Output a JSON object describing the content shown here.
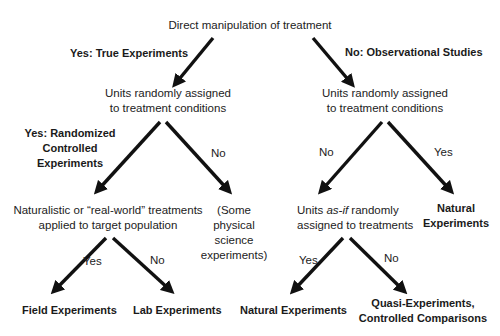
{
  "diagram": {
    "root": "Direct manipulation of treatment",
    "branch_labels": {
      "root_yes": "Yes: True Experiments",
      "root_no": "No: Observational Studies",
      "left_yes": "Yes: Randomized",
      "left_yes_2": "Controlled",
      "left_yes_3": "Experiments",
      "left_no": "No",
      "right_no": "No",
      "right_yes": "Yes",
      "ll_yes": "Yes",
      "ll_no": "No",
      "rl_yes": "Yes",
      "rl_no": "No"
    },
    "nodes": {
      "left_q_line1": "Units randomly assigned",
      "left_q_line2": "to treatment conditions",
      "right_q_line1": "Units randomly assigned",
      "right_q_line2": "to treatment conditions",
      "naturalistic_line1": "Naturalistic or “real-world” treatments",
      "naturalistic_line2": "applied to target population",
      "physical_line1": "(Some",
      "physical_line2": "physical",
      "physical_line3": "science",
      "physical_line4": "experiments)",
      "asif_pre": "Units ",
      "asif_em": "as-if",
      "asif_post": " randomly",
      "asif_line2": "assigned to treatments",
      "natural_exp_right_1": "Natural",
      "natural_exp_right_2": "Experiments",
      "field_exp": "Field Experiments",
      "lab_exp": "Lab Experiments",
      "natural_exp_bottom": "Natural Experiments",
      "quasi_line1": "Quasi-Experiments,",
      "quasi_line2": "Controlled Comparisons"
    },
    "arrow_color": "#111111"
  }
}
